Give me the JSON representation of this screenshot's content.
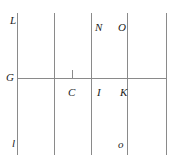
{
  "figure": {
    "type": "geometric-line-diagram",
    "width": 180,
    "height": 165,
    "background_color": "#ffffff",
    "line_color": "#8a8a8a",
    "label_color": "#1c1c1c",
    "vertical_lines": [
      {
        "id": "v1",
        "x": 17,
        "y_top": 13,
        "y_bottom": 155
      },
      {
        "id": "v2",
        "x": 54,
        "y_top": 13,
        "y_bottom": 155
      },
      {
        "id": "v3",
        "x": 91,
        "y_top": 13,
        "y_bottom": 155
      },
      {
        "id": "v4",
        "x": 127,
        "y_top": 13,
        "y_bottom": 155
      },
      {
        "id": "v5",
        "x": 166,
        "y_top": 13,
        "y_bottom": 155
      }
    ],
    "horizontal_lines": [
      {
        "id": "h1",
        "y": 78,
        "x_left": 17,
        "x_right": 166
      }
    ],
    "ticks": [
      {
        "id": "tick-c",
        "x": 72,
        "y_top": 70,
        "y_bottom": 78
      }
    ],
    "labels": [
      {
        "id": "label-L",
        "text": "L",
        "x": 10,
        "y": 15
      },
      {
        "id": "label-N",
        "text": "N",
        "x": 95,
        "y": 22
      },
      {
        "id": "label-O",
        "text": "O",
        "x": 118,
        "y": 22
      },
      {
        "id": "label-G",
        "text": "G",
        "x": 6,
        "y": 72
      },
      {
        "id": "label-C",
        "text": "C",
        "x": 68,
        "y": 87
      },
      {
        "id": "label-I",
        "text": "I",
        "x": 97,
        "y": 87
      },
      {
        "id": "label-K",
        "text": "K",
        "x": 120,
        "y": 87
      },
      {
        "id": "label-l",
        "text": "l",
        "x": 12,
        "y": 138
      },
      {
        "id": "label-o",
        "text": "o",
        "x": 118,
        "y": 139
      }
    ]
  }
}
